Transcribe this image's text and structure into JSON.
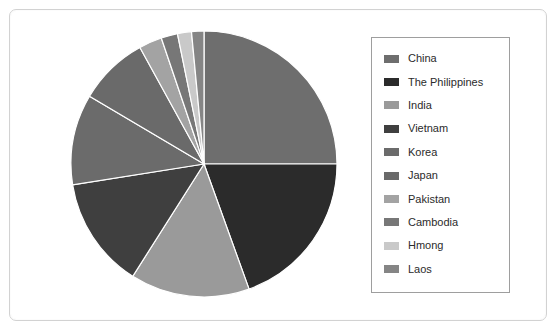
{
  "page": {
    "background_color": "#ffffff",
    "frame_border_color": "#d2d2d2"
  },
  "legend": {
    "border_color": "#9e9e9e",
    "position": "right",
    "items": [
      {
        "label": "China",
        "color": "#6e6e6e"
      },
      {
        "label": "The Philippines",
        "color": "#2b2b2b"
      },
      {
        "label": "India",
        "color": "#9a9a9a"
      },
      {
        "label": "Vietnam",
        "color": "#3f3f3f"
      },
      {
        "label": "Korea",
        "color": "#6b6b6b"
      },
      {
        "label": "Japan",
        "color": "#6a6a6a"
      },
      {
        "label": "Pakistan",
        "color": "#a3a3a3"
      },
      {
        "label": "Cambodia",
        "color": "#777777"
      },
      {
        "label": "Hmong",
        "color": "#c9c9c9"
      },
      {
        "label": "Laos",
        "color": "#858585"
      }
    ]
  },
  "chart_data": {
    "type": "pie",
    "title": "",
    "xlabel": "",
    "ylabel": "",
    "legend_position": "right",
    "grid": false,
    "start_angle_deg": 0,
    "direction": "clockwise",
    "center": {
      "x": 134,
      "y": 134
    },
    "radius": 133,
    "categories": [
      "China",
      "The Philippines",
      "India",
      "Vietnam",
      "Korea",
      "Japan",
      "Pakistan",
      "Cambodia",
      "Hmong",
      "Laos"
    ],
    "values": [
      25.0,
      19.5,
      14.5,
      13.5,
      11.0,
      8.5,
      2.8,
      2.0,
      1.7,
      1.5
    ],
    "unit": "percent",
    "colors": [
      "#6e6e6e",
      "#2b2b2b",
      "#9a9a9a",
      "#3f3f3f",
      "#6b6b6b",
      "#6a6a6a",
      "#a3a3a3",
      "#777777",
      "#c9c9c9",
      "#858585"
    ],
    "slice_separator_color": "#ffffff"
  }
}
